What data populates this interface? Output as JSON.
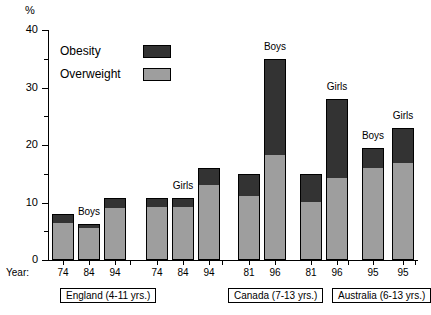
{
  "axis": {
    "unit_label": "%",
    "y_ticks_major": [
      0,
      10,
      20,
      30,
      40
    ],
    "y_ticks_minor": [
      5,
      15,
      25,
      35
    ],
    "year_prefix": "Year:"
  },
  "legend": {
    "items": [
      {
        "label": "Obesity",
        "color": "#333333",
        "key": "obesity"
      },
      {
        "label": "Overweight",
        "color": "#9e9e9e",
        "key": "overweight"
      }
    ]
  },
  "groups": [
    {
      "label": "England (4-11 yrs.)",
      "sexes": [
        "Boys",
        "Girls"
      ]
    },
    {
      "label": "Canada (7-13 yrs.)",
      "sexes": [
        "Boys",
        "Girls"
      ]
    },
    {
      "label": "Australia (6-13 yrs.)",
      "sexes": [
        "Boys",
        "Girls"
      ]
    }
  ],
  "chart_data": {
    "type": "bar",
    "title": "",
    "xlabel": "Year:",
    "ylabel": "%",
    "ylim": [
      0,
      40
    ],
    "grid": false,
    "legend_position": "upper-left-inside",
    "stacked": true,
    "series": [
      {
        "name": "Overweight",
        "color": "#9e9e9e",
        "values": [
          6.5,
          5.8,
          9.1,
          9.4,
          9.4,
          13.2,
          11.2,
          18.2,
          10.1,
          14.2,
          16.2,
          17.0
        ]
      },
      {
        "name": "Obesity",
        "color": "#333333",
        "values": [
          1.5,
          0.4,
          1.6,
          1.3,
          1.3,
          2.8,
          3.8,
          16.8,
          4.9,
          13.8,
          3.3,
          6.0
        ]
      }
    ],
    "totals": [
      8.0,
      6.2,
      10.7,
      10.7,
      10.7,
      16.0,
      15.0,
      35.0,
      15.0,
      28.0,
      19.5,
      23.0
    ],
    "categories": [
      "74",
      "84",
      "94",
      "74",
      "84",
      "94",
      "81",
      "96",
      "81",
      "96",
      "95",
      "95"
    ],
    "category_groups": [
      "England (4-11 yrs.)",
      "England (4-11 yrs.)",
      "England (4-11 yrs.)",
      "England (4-11 yrs.)",
      "England (4-11 yrs.)",
      "England (4-11 yrs.)",
      "Canada (7-13 yrs.)",
      "Canada (7-13 yrs.)",
      "Canada (7-13 yrs.)",
      "Canada (7-13 yrs.)",
      "Australia (6-13 yrs.)",
      "Australia (6-13 yrs.)"
    ],
    "category_sex": [
      "Boys",
      "Boys",
      "Boys",
      "Girls",
      "Girls",
      "Girls",
      "Boys",
      "Boys",
      "Girls",
      "Girls",
      "Boys",
      "Girls"
    ],
    "annotations": [
      {
        "text": "Boys",
        "bar_index": 1
      },
      {
        "text": "Girls",
        "bar_index": 4
      },
      {
        "text": "Boys",
        "bar_index": 7
      },
      {
        "text": "Girls",
        "bar_index": 9
      },
      {
        "text": "Boys",
        "bar_index": 10
      },
      {
        "text": "Girls",
        "bar_index": 11
      }
    ]
  }
}
